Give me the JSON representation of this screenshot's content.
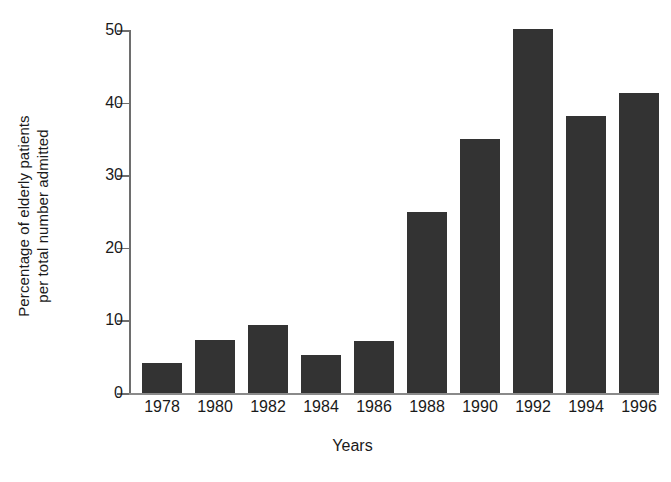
{
  "chart_data": {
    "type": "bar",
    "title": "",
    "subtitle": "",
    "xlabel": "Years",
    "ylabel": "Percentage of elderly patients per total number admitted",
    "ylabel_lines": [
      "Percentage of elderly patients",
      "per total number admitted"
    ],
    "categories": [
      "1978",
      "1980",
      "1982",
      "1984",
      "1986",
      "1988",
      "1990",
      "1992",
      "1994",
      "1996"
    ],
    "values": [
      4.2,
      7.3,
      9.4,
      5.2,
      7.2,
      25.0,
      35.0,
      50.1,
      38.2,
      41.3
    ],
    "series": [
      {
        "name": "Percentage of elderly patients per total number admitted",
        "values": [
          4.2,
          7.3,
          9.4,
          5.2,
          7.2,
          25.0,
          35.0,
          50.1,
          38.2,
          41.3
        ]
      }
    ],
    "ylim": [
      0,
      50
    ],
    "xlim_note": "categorical",
    "y_ticks": [
      0,
      10,
      20,
      30,
      40,
      50
    ],
    "y_tick_labels": [
      "0",
      "10",
      "20",
      "30",
      "40",
      "50"
    ],
    "x_tick_labels": [
      "1978",
      "1980",
      "1982",
      "1984",
      "1986",
      "1988",
      "1990",
      "1992",
      "1994",
      "1996"
    ],
    "grid": false,
    "legend": false,
    "legend_position": "none",
    "bar_color": "#333333",
    "axis_color": "#6e6e6e",
    "background_color": "#ffffff",
    "annotations": []
  }
}
